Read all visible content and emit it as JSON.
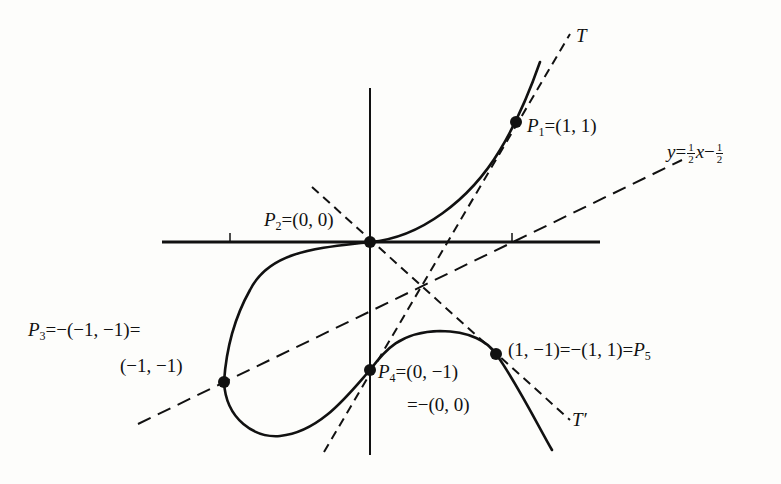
{
  "figure": {
    "type": "elliptic-curve-group-law-diagram",
    "curve": "y^2 + y = x^3 - x (cubic curve with points P1..P5)",
    "colors": {
      "ink": "#111111",
      "background": "#fdfdfb"
    }
  },
  "labels": {
    "T": {
      "name": "T"
    },
    "T_prime": {
      "name": "T′"
    },
    "line": {
      "lhs": "y",
      "eq": "=",
      "num1": "1",
      "den1": "2",
      "x": "x",
      "minus": "−",
      "num2": "1",
      "den2": "2"
    },
    "P1": {
      "letter": "P",
      "sub": "1",
      "text": "=(1, 1)"
    },
    "P2": {
      "letter": "P",
      "sub": "2",
      "text": "=(0, 0)"
    },
    "P3": {
      "letter": "P",
      "sub": "3",
      "text_line1": "=−(−1, −1)=",
      "text_line2": "(−1, −1)"
    },
    "P4": {
      "letter": "P",
      "sub": "4",
      "text_line1": "=(0, −1)",
      "text_line2": "=−(0, 0)"
    },
    "P5": {
      "text": "(1, −1)=−(1, 1)=",
      "letter": "P",
      "sub": "5"
    }
  },
  "points": [
    {
      "id": "P1",
      "coords": [
        1,
        1
      ]
    },
    {
      "id": "P2",
      "coords": [
        0,
        0
      ]
    },
    {
      "id": "P3",
      "coords": [
        -1,
        -1
      ]
    },
    {
      "id": "P4",
      "coords": [
        0,
        -1
      ]
    },
    {
      "id": "P5",
      "coords": [
        1,
        -1
      ]
    }
  ],
  "lines": [
    {
      "id": "T",
      "style": "dashed",
      "description": "tangent at P1"
    },
    {
      "id": "T_prime",
      "style": "dashed",
      "description": "line through P2 and P5"
    },
    {
      "id": "secant",
      "style": "dashed",
      "equation": "y = 1/2 x − 1/2"
    }
  ],
  "axes": {
    "x_ticks": [
      -1,
      1
    ]
  }
}
